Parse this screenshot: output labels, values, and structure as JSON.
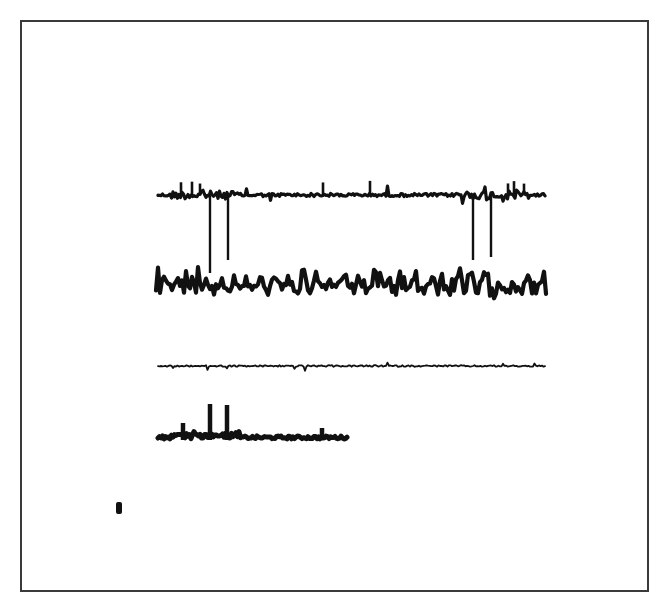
{
  "figure": {
    "background": "#ffffff",
    "ink": "#111111",
    "frame_color": "#3a3a3a"
  },
  "chart_data": {
    "type": "line",
    "title": "",
    "xlabel": "",
    "ylabel": "",
    "grid": false,
    "legend": "none",
    "series": [
      {
        "name": "trace-1",
        "x_range": [
          158,
          546
        ],
        "baseline_y": 195,
        "style": "spiky baseline, moderate thickness",
        "up_spikes_x": [
          181,
          192,
          200,
          323,
          370,
          508,
          514,
          524
        ],
        "up_spike_top_y": 180
      },
      {
        "name": "trace-2",
        "x_range": [
          156,
          546
        ],
        "baseline_y": 285,
        "style": "thick dense oscillation, amplitude ~15px"
      },
      {
        "name": "trace-3",
        "x_range": [
          158,
          546
        ],
        "baseline_y": 366,
        "style": "thin, low amplitude noise"
      },
      {
        "name": "trace-4",
        "x_range": [
          158,
          347
        ],
        "baseline_y": 440,
        "style": "thick baseline with peaks",
        "peaks": [
          {
            "x": 183,
            "top_y": 423
          },
          {
            "x": 210,
            "top_y": 404
          },
          {
            "x": 227,
            "top_y": 405
          },
          {
            "x": 322,
            "top_y": 428
          }
        ]
      }
    ],
    "markers": {
      "vertical_lines": [
        {
          "x": 210,
          "y_from": 196,
          "y_to": 273
        },
        {
          "x": 228,
          "y_from": 196,
          "y_to": 260
        },
        {
          "x": 473,
          "y_from": 196,
          "y_to": 260
        },
        {
          "x": 491,
          "y_from": 196,
          "y_to": 257
        }
      ],
      "calibration_blob": {
        "x": 119,
        "y": 508,
        "w": 6,
        "h": 12
      }
    }
  }
}
